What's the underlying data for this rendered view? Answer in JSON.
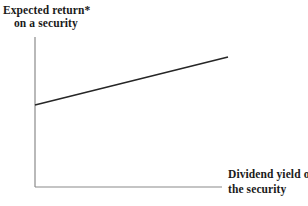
{
  "figure": {
    "background_color": "#ffffff",
    "width": 308,
    "height": 206
  },
  "labels": {
    "y_axis_line1": "Expected return*",
    "y_axis_line2": "on a security",
    "x_axis_line1": "Dividend yield on",
    "x_axis_line2": "the security"
  },
  "chart_data": {
    "type": "line",
    "title": "",
    "subtitle": "",
    "xlabel": "Dividend yield on the security",
    "ylabel": "Expected return* on a security",
    "annotations": [
      "*"
    ],
    "grid": false,
    "legend": null,
    "ticks": {
      "x": [],
      "y": []
    },
    "xlim": [
      0,
      1
    ],
    "ylim": [
      0,
      1
    ],
    "axis_color": "#8a8a8a",
    "line_color": "#262626",
    "series": [
      {
        "name": "expected return vs dividend yield",
        "x": [
          0.0,
          1.0
        ],
        "y": [
          0.547,
          0.867
        ],
        "relationship": "positive linear",
        "intercept": 0.547,
        "slope": 0.32
      }
    ]
  },
  "geometry": {
    "axis_origin_x": 35,
    "axis_origin_y": 187,
    "y_axis_top": 37,
    "x_axis_right": 222,
    "line_start_x": 35,
    "line_start_y": 105,
    "line_end_x": 228,
    "line_end_y": 57
  }
}
